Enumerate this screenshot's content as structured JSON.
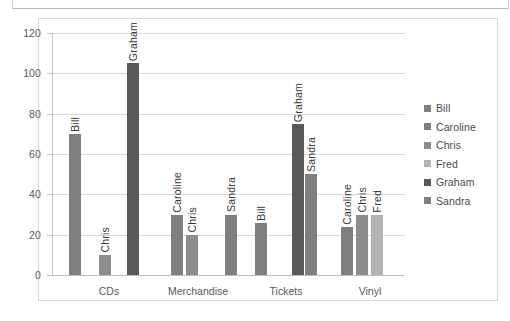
{
  "chart_data": {
    "type": "bar",
    "title": "",
    "xlabel": "",
    "ylabel": "",
    "ylim": [
      0,
      120
    ],
    "yticks": [
      0,
      20,
      40,
      60,
      80,
      100,
      120
    ],
    "grid": true,
    "legend_position": "right",
    "categories": [
      "CDs",
      "Merchandise",
      "Tickets",
      "Vinyl"
    ],
    "series": [
      {
        "name": "Bill",
        "color": "#7f7f7f"
      },
      {
        "name": "Caroline",
        "color": "#7f7f7f"
      },
      {
        "name": "Chris",
        "color": "#8c8c8c"
      },
      {
        "name": "Fred",
        "color": "#b3b3b3"
      },
      {
        "name": "Graham",
        "color": "#595959"
      },
      {
        "name": "Sandra",
        "color": "#7f7f7f"
      }
    ],
    "groups": [
      {
        "category": "CDs",
        "bars": [
          {
            "label": "Bill",
            "value": 70,
            "color": "#7f7f7f"
          },
          {
            "label": "Chris",
            "value": 10,
            "color": "#8c8c8c"
          },
          {
            "label": "Graham",
            "value": 105,
            "color": "#595959"
          }
        ]
      },
      {
        "category": "Merchandise",
        "bars": [
          {
            "label": "Caroline",
            "value": 30,
            "color": "#7f7f7f"
          },
          {
            "label": "Chris",
            "value": 20,
            "color": "#8c8c8c"
          }
        ]
      },
      {
        "category": "Tickets",
        "bars": [
          {
            "label": "Sandra",
            "value": 30,
            "color": "#7f7f7f"
          },
          {
            "label": "Bill",
            "value": 26,
            "color": "#7f7f7f"
          },
          {
            "label": "Graham",
            "value": 75,
            "color": "#595959"
          },
          {
            "label": "Sandra",
            "value": 50,
            "color": "#7f7f7f"
          }
        ]
      },
      {
        "category": "Vinyl",
        "bars": [
          {
            "label": "Caroline",
            "value": 24,
            "color": "#7f7f7f"
          },
          {
            "label": "Chris",
            "value": 30,
            "color": "#8c8c8c"
          },
          {
            "label": "Fred",
            "value": 30,
            "color": "#b3b3b3"
          }
        ]
      }
    ],
    "legend": [
      "Bill",
      "Caroline",
      "Chris",
      "Fred",
      "Graham",
      "Sandra"
    ]
  },
  "layout": {
    "plot_left": 52,
    "plot_right": 404,
    "plot_top": 33,
    "plot_bottom": 275,
    "legend_left": 424,
    "legend_top": 99,
    "bar_positions": [
      {
        "x": 69,
        "group": 0,
        "index": 0
      },
      {
        "x": 99,
        "group": 0,
        "index": 1
      },
      {
        "x": 127,
        "group": 0,
        "index": 2
      },
      {
        "x": 171,
        "group": 1,
        "index": 0
      },
      {
        "x": 186,
        "group": 1,
        "index": 1
      },
      {
        "x": 225,
        "group": 1,
        "index": 2
      },
      {
        "x": 255,
        "group": 2,
        "index": 0
      },
      {
        "x": 292,
        "group": 2,
        "index": 1
      },
      {
        "x": 305,
        "group": 2,
        "index": 2
      },
      {
        "x": 341,
        "group": 3,
        "index": 0
      },
      {
        "x": 356,
        "group": 3,
        "index": 1
      },
      {
        "x": 371,
        "group": 3,
        "index": 2
      }
    ],
    "category_x": [
      109,
      198,
      286,
      370
    ]
  }
}
